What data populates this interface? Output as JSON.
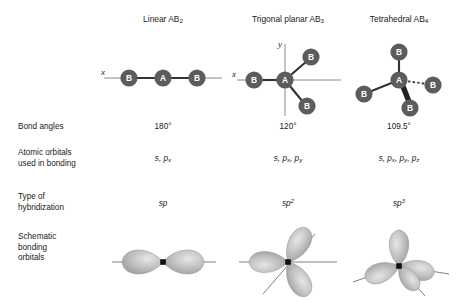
{
  "figure": {
    "columns": [
      {
        "id": "linear",
        "heading_text": "Linear AB",
        "heading_sub": "2",
        "bond_angle": "180°",
        "atomic_orbitals": "s, p",
        "atomic_orbitals_sub": "x",
        "hybridization": "sp",
        "hybridization_sup": "",
        "axis_labels": [
          "x"
        ],
        "central_atom": "A",
        "terminal_atom": "B",
        "terminal_count": 2,
        "lobe_count": 2
      },
      {
        "id": "trigonal-planar",
        "heading_text": "Trigonal planar AB",
        "heading_sub": "3",
        "bond_angle": "120°",
        "atomic_orbitals": "s, p",
        "atomic_orbitals_sub": "x",
        "atomic_orbitals_2": ", p",
        "atomic_orbitals_sub_2": "y",
        "hybridization": "sp",
        "hybridization_sup": "2",
        "axis_labels": [
          "x",
          "y"
        ],
        "central_atom": "A",
        "terminal_atom": "B",
        "terminal_count": 3,
        "lobe_count": 3
      },
      {
        "id": "tetrahedral",
        "heading_text": "Tetrahedral AB",
        "heading_sub": "4",
        "bond_angle": "109.5°",
        "atomic_orbitals": "s, p",
        "atomic_orbitals_sub": "x",
        "atomic_orbitals_2": ", p",
        "atomic_orbitals_sub_2": "y",
        "atomic_orbitals_3": ", p",
        "atomic_orbitals_sub_3": "z",
        "hybridization": "sp",
        "hybridization_sup": "3",
        "axis_labels": [],
        "central_atom": "A",
        "terminal_atom": "B",
        "terminal_count": 4,
        "lobe_count": 4
      }
    ],
    "rows": [
      {
        "id": "geometry",
        "label": ""
      },
      {
        "id": "bond-angles",
        "label": "Bond angles"
      },
      {
        "id": "atomic-orbitals",
        "label": "Atomic orbitals\nused in bonding"
      },
      {
        "id": "hybridization",
        "label": "Type of\nhybridization"
      },
      {
        "id": "schematic",
        "label": "Schematic\nbonding\norbitals"
      }
    ],
    "colors": {
      "atom_fill": "#5c5c5c",
      "atom_label": "#ffffff",
      "bond": "#333333",
      "axis": "#8a8a8a",
      "lobe": "#b7b7b7",
      "lobe_edge": "#8f8f8f",
      "nucleus": "#111111",
      "text": "#1a1a1a",
      "background": "#ffffff"
    }
  }
}
